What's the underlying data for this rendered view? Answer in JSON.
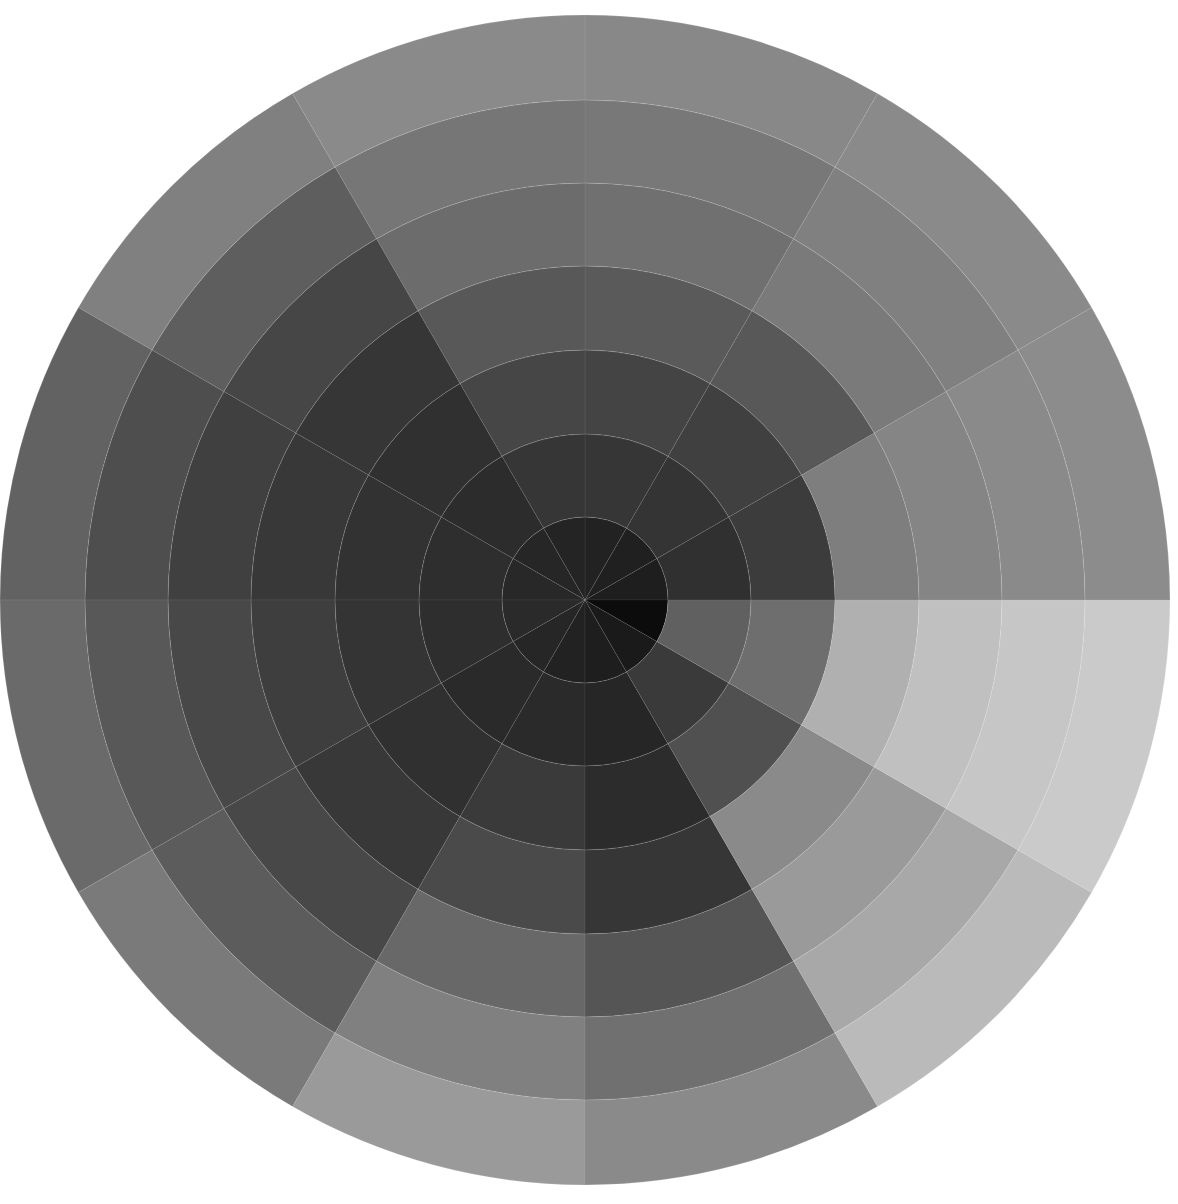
{
  "artwork": {
    "type": "grayscale tonal wheel painting",
    "center": [
      585,
      600
    ],
    "ring_radii": [
      83,
      166,
      250,
      334,
      417,
      500,
      585
    ],
    "sector_count": 12,
    "sector_degrees": 30,
    "sectors": [
      {
        "index": 0,
        "start_deg": 0,
        "tones": [
          "#1e1e1e",
          "#303030",
          "#3c3c3c",
          "#7e7e7e",
          "#858585",
          "#8a8a8a",
          "#8c8c8c"
        ]
      },
      {
        "index": 1,
        "start_deg": 30,
        "tones": [
          "#202020",
          "#343434",
          "#404040",
          "#585858",
          "#7a7a7a",
          "#808080",
          "#8a8a8a"
        ]
      },
      {
        "index": 2,
        "start_deg": 60,
        "tones": [
          "#222222",
          "#363636",
          "#444444",
          "#5a5a5a",
          "#707070",
          "#787878",
          "#888888"
        ]
      },
      {
        "index": 3,
        "start_deg": 90,
        "tones": [
          "#242424",
          "#363636",
          "#464646",
          "#585858",
          "#6c6c6c",
          "#767676",
          "#8a8a8a"
        ]
      },
      {
        "index": 4,
        "start_deg": 120,
        "tones": [
          "#262626",
          "#2c2c2c",
          "#303030",
          "#363636",
          "#464646",
          "#5e5e5e",
          "#808080"
        ]
      },
      {
        "index": 5,
        "start_deg": 150,
        "tones": [
          "#282828",
          "#2e2e2e",
          "#323232",
          "#383838",
          "#404040",
          "#4e4e4e",
          "#626262"
        ]
      },
      {
        "index": 6,
        "start_deg": 180,
        "tones": [
          "#2a2a2a",
          "#2e2e2e",
          "#343434",
          "#3e3e3e",
          "#484848",
          "#585858",
          "#6a6a6a"
        ]
      },
      {
        "index": 7,
        "start_deg": 210,
        "tones": [
          "#262626",
          "#2a2a2a",
          "#303030",
          "#383838",
          "#484848",
          "#5c5c5c",
          "#7a7a7a"
        ]
      },
      {
        "index": 8,
        "start_deg": 240,
        "tones": [
          "#222222",
          "#2a2a2a",
          "#3a3a3a",
          "#4a4a4a",
          "#686868",
          "#808080",
          "#9a9a9a"
        ]
      },
      {
        "index": 9,
        "start_deg": 270,
        "tones": [
          "#1e1e1e",
          "#262626",
          "#2c2c2c",
          "#363636",
          "#555555",
          "#707070",
          "#8a8a8a"
        ]
      },
      {
        "index": 10,
        "start_deg": 300,
        "tones": [
          "#1a1a1a",
          "#3a3a3a",
          "#505050",
          "#8a8a8a",
          "#9a9a9a",
          "#a8a8a8",
          "#bababa"
        ]
      },
      {
        "index": 11,
        "start_deg": 330,
        "tones": [
          "#0c0c0c",
          "#606060",
          "#6e6e6e",
          "#b0b0b0",
          "#c0c0c0",
          "#c6c6c6",
          "#cacaca"
        ]
      }
    ],
    "background": "#ffffff"
  }
}
